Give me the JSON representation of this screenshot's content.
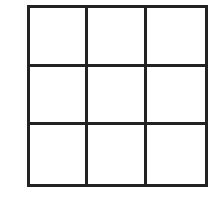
{
  "diagram": {
    "type": "grid",
    "rows": 3,
    "columns": 3,
    "line_color": "#222222",
    "background_color": "#ffffff",
    "cells": [
      [
        "",
        "",
        ""
      ],
      [
        "",
        "",
        ""
      ],
      [
        "",
        "",
        ""
      ]
    ]
  }
}
